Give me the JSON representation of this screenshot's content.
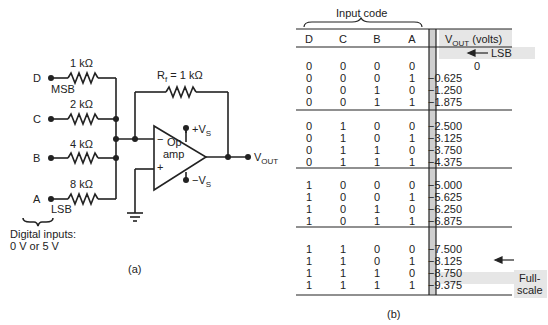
{
  "figure_a": {
    "caption": "(a)",
    "inputs": [
      {
        "name": "D",
        "resistor": "1 kΩ",
        "tag": "MSB"
      },
      {
        "name": "C",
        "resistor": "2 kΩ",
        "tag": ""
      },
      {
        "name": "B",
        "resistor": "4 kΩ",
        "tag": ""
      },
      {
        "name": "A",
        "resistor": "8 kΩ",
        "tag": "LSB"
      }
    ],
    "feedback_resistor": "R",
    "feedback_sub": "f",
    "feedback_value": " = 1 kΩ",
    "opamp_line1": "Op",
    "opamp_line2": "amp",
    "minus_sign": "−",
    "plus_sign": "+",
    "pos_supply": "+V",
    "neg_supply": "−V",
    "supply_sub": "S",
    "output_label": "V",
    "output_sub": "OUT",
    "digital_inputs_line1": "Digital inputs:",
    "digital_inputs_line2": "0 V or 5 V"
  },
  "figure_b": {
    "caption": "(b)",
    "group_label": "Input code",
    "headers": [
      "D",
      "C",
      "B",
      "A"
    ],
    "vout_header": "V",
    "vout_header_sub": "OUT",
    "vout_header_unit": " (volts)",
    "groups": [
      {
        "rows": [
          {
            "bits": [
              "0",
              "0",
              "0",
              "0"
            ],
            "vout": "0"
          },
          {
            "bits": [
              "0",
              "0",
              "0",
              "1"
            ],
            "vout": "−0.625"
          },
          {
            "bits": [
              "0",
              "0",
              "1",
              "0"
            ],
            "vout": "−1.250"
          },
          {
            "bits": [
              "0",
              "0",
              "1",
              "1"
            ],
            "vout": "−1.875"
          }
        ]
      },
      {
        "rows": [
          {
            "bits": [
              "0",
              "1",
              "0",
              "0"
            ],
            "vout": "−2.500"
          },
          {
            "bits": [
              "0",
              "1",
              "0",
              "1"
            ],
            "vout": "−3.125"
          },
          {
            "bits": [
              "0",
              "1",
              "1",
              "0"
            ],
            "vout": "−3.750"
          },
          {
            "bits": [
              "0",
              "1",
              "1",
              "1"
            ],
            "vout": "−4.375"
          }
        ]
      },
      {
        "rows": [
          {
            "bits": [
              "1",
              "0",
              "0",
              "0"
            ],
            "vout": "−5.000"
          },
          {
            "bits": [
              "1",
              "0",
              "0",
              "1"
            ],
            "vout": "−5.625"
          },
          {
            "bits": [
              "1",
              "0",
              "1",
              "0"
            ],
            "vout": "−6.250"
          },
          {
            "bits": [
              "1",
              "0",
              "1",
              "1"
            ],
            "vout": "−6.875"
          }
        ]
      },
      {
        "rows": [
          {
            "bits": [
              "1",
              "1",
              "0",
              "0"
            ],
            "vout": "−7.500"
          },
          {
            "bits": [
              "1",
              "1",
              "0",
              "1"
            ],
            "vout": "−8.125"
          },
          {
            "bits": [
              "1",
              "1",
              "1",
              "0"
            ],
            "vout": "−8.750"
          },
          {
            "bits": [
              "1",
              "1",
              "1",
              "1"
            ],
            "vout": "−9.375"
          }
        ]
      }
    ],
    "annotations": {
      "lsb": "LSB",
      "fullscale_line1": "Full-",
      "fullscale_line2": "scale"
    }
  },
  "colors": {
    "ink": "#222222",
    "shade": "#e6e6e6",
    "bar": "#cfcfcf"
  }
}
